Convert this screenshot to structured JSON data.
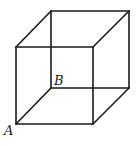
{
  "figure": {
    "type": "wireframe-cube",
    "stroke_color": "#1a1a1a",
    "background": "#ffffff",
    "vertices": {
      "front_top_left": [
        16,
        47
      ],
      "front_top_right": [
        93,
        47
      ],
      "front_bottom_left": [
        16,
        124
      ],
      "front_bottom_right": [
        93,
        124
      ],
      "back_top_left": [
        51,
        11
      ],
      "back_top_right": [
        129,
        11
      ],
      "back_bottom_left": [
        51,
        88
      ],
      "back_bottom_right": [
        129,
        88
      ]
    },
    "labels": [
      {
        "text": "A",
        "vertex": "front_bottom_left"
      },
      {
        "text": "B",
        "vertex": "back_bottom_left"
      }
    ]
  }
}
